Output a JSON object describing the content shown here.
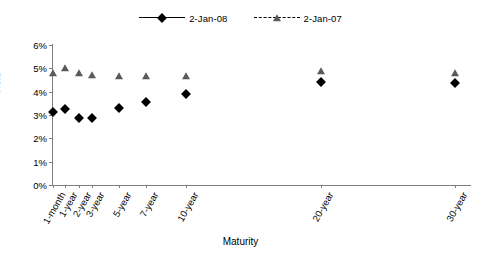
{
  "chart_data": {
    "type": "scatter",
    "title": "",
    "xlabel": "Maturity",
    "ylabel": "Yield",
    "categories": [
      "1-month",
      "1-year",
      "2-year",
      "3-year",
      "5-year",
      "7-year",
      "10-year",
      "20-year",
      "30-year"
    ],
    "x_positions_years": [
      0.0833,
      1,
      2,
      3,
      5,
      7,
      10,
      20,
      30
    ],
    "ylim": [
      0,
      6
    ],
    "y_unit": "%",
    "y_ticks": [
      "0%",
      "1%",
      "2%",
      "3%",
      "4%",
      "5%",
      "6%"
    ],
    "y_tick_values": [
      0,
      1,
      2,
      3,
      4,
      5,
      6
    ],
    "grid": false,
    "legend_position": "top-center",
    "series": [
      {
        "name": "2-Jan-08",
        "marker": "diamond",
        "line_style": "solid",
        "color": "#000000",
        "values": [
          3.12,
          3.26,
          2.88,
          2.89,
          3.28,
          3.55,
          3.91,
          4.42,
          4.37
        ]
      },
      {
        "name": "2-Jan-07",
        "marker": "triangle",
        "line_style": "dashed",
        "color": "#5a5a5a",
        "values": [
          4.79,
          5.0,
          4.8,
          4.7,
          4.67,
          4.67,
          4.68,
          4.88,
          4.81
        ]
      }
    ]
  },
  "legend": {
    "entries": [
      {
        "label": "2-Jan-08"
      },
      {
        "label": "2-Jan-07"
      }
    ]
  },
  "axes": {
    "y_title": "Yield",
    "x_title": "Maturity"
  }
}
